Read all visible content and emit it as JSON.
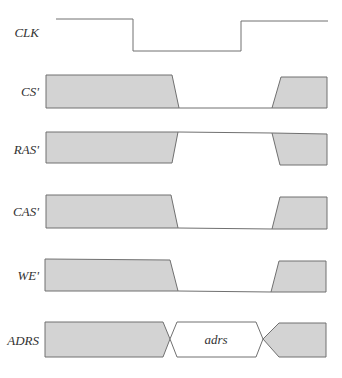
{
  "diagram": {
    "type": "timing-diagram",
    "colors": {
      "fill": "#d3d3d3",
      "stroke": "#707070",
      "text": "#333333",
      "background": "#ffffff"
    },
    "signals": [
      {
        "id": "clk",
        "label": "CLK"
      },
      {
        "id": "cs",
        "label": "CS'"
      },
      {
        "id": "ras",
        "label": "RAS'"
      },
      {
        "id": "cas",
        "label": "CAS'"
      },
      {
        "id": "we",
        "label": "WE'"
      },
      {
        "id": "adrs",
        "label": "ADRS",
        "value_label": "adrs"
      }
    ]
  }
}
